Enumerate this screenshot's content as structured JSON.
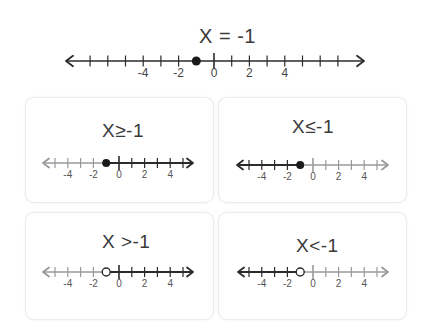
{
  "main": {
    "title": "X = -1",
    "type": "equal",
    "point": -1,
    "point_style": "closed",
    "shade": "none",
    "ticks": [
      -7,
      -6,
      -5,
      -4,
      -3,
      -2,
      -1,
      0,
      1,
      2,
      3,
      4,
      5,
      6,
      7
    ],
    "labels": [
      "-4",
      "-2",
      "0",
      "2",
      "4"
    ]
  },
  "cards": [
    {
      "title": "X≥-1",
      "type": "greater_equal",
      "point": -1,
      "point_style": "closed",
      "shade": "right"
    },
    {
      "title": "X≤-1",
      "type": "less_equal",
      "point": -1,
      "point_style": "closed",
      "shade": "left"
    },
    {
      "title": "X >-1",
      "type": "greater",
      "point": -1,
      "point_style": "open",
      "shade": "right"
    },
    {
      "title": "X<-1",
      "type": "less",
      "point": -1,
      "point_style": "open",
      "shade": "left"
    }
  ],
  "small_labels": [
    "-4",
    "-2",
    "0",
    "2",
    "4"
  ],
  "colors": {
    "line_dark": "#2b2b2b",
    "line_light": "#9a9a9a",
    "point": "#1a1a1a",
    "card_border": "#ececec"
  },
  "chart_data": [
    {
      "type": "number_line",
      "title": "X = -1",
      "range": [
        -7,
        7
      ],
      "point": -1,
      "closed": true,
      "shaded": "none"
    },
    {
      "type": "number_line",
      "title": "X≥-1",
      "range": [
        -5,
        5
      ],
      "point": -1,
      "closed": true,
      "shaded": "right"
    },
    {
      "type": "number_line",
      "title": "X≤-1",
      "range": [
        -5,
        5
      ],
      "point": -1,
      "closed": true,
      "shaded": "left"
    },
    {
      "type": "number_line",
      "title": "X>-1",
      "range": [
        -5,
        5
      ],
      "point": -1,
      "closed": false,
      "shaded": "right"
    },
    {
      "type": "number_line",
      "title": "X<-1",
      "range": [
        -5,
        5
      ],
      "point": -1,
      "closed": false,
      "shaded": "left"
    }
  ]
}
